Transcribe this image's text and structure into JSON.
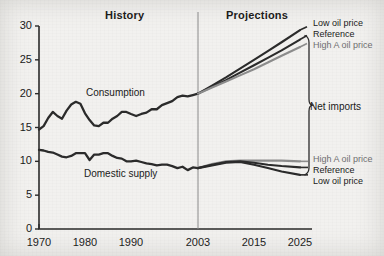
{
  "figure": {
    "background_color": "#f2f1ef",
    "ink_color": "#2b2b2b",
    "grey_series_color": "#8d8d8d"
  },
  "headers": {
    "history": "History",
    "projections": "Projections"
  },
  "inline_labels": {
    "consumption": "Consumption",
    "domestic_supply": "Domestic supply",
    "net_imports": "Net imports"
  },
  "upper_legend": [
    {
      "label": "Low oil price",
      "color": "#2b2b2b"
    },
    {
      "label": "Reference",
      "color": "#2b2b2b"
    },
    {
      "label": "High A oil price",
      "color": "#8d8d8d"
    }
  ],
  "lower_legend": [
    {
      "label": "High A oil price",
      "color": "#8d8d8d"
    },
    {
      "label": "Reference",
      "color": "#2b2b2b"
    },
    {
      "label": "Low oil price",
      "color": "#2b2b2b"
    }
  ],
  "chart_data": {
    "type": "line",
    "title": "",
    "subtitle": "",
    "xlabel": "",
    "ylabel": "",
    "xlim": [
      1970,
      2025
    ],
    "ylim": [
      0,
      30
    ],
    "grid": false,
    "legend_position": "right-inline",
    "x_ticks": [
      1970,
      1980,
      1990,
      2003,
      2015,
      2025
    ],
    "y_ticks": [
      0,
      5,
      10,
      15,
      20,
      25,
      30
    ],
    "annotations": [
      {
        "text": "History",
        "x": 1986,
        "y": 31.5
      },
      {
        "text": "Projections",
        "x": 2013,
        "y": 31.5
      },
      {
        "text": "Consumption",
        "x": 1985,
        "y": 20.6
      },
      {
        "text": "Domestic supply",
        "x": 1985,
        "y": 7.9
      },
      {
        "text": "Net imports",
        "x": 2027,
        "y": 15.5
      }
    ],
    "divider_x": 2003,
    "series": [
      {
        "name": "Consumption (history)",
        "color": "#2b2b2b",
        "phase": "history",
        "x": [
          1970,
          1971,
          1972,
          1973,
          1974,
          1975,
          1976,
          1977,
          1978,
          1979,
          1980,
          1981,
          1982,
          1983,
          1984,
          1985,
          1986,
          1987,
          1988,
          1989,
          1990,
          1991,
          1992,
          1993,
          1994,
          1995,
          1996,
          1997,
          1998,
          1999,
          2000,
          2001,
          2002,
          2003
        ],
        "values": [
          14.7,
          15.2,
          16.4,
          17.3,
          16.7,
          16.3,
          17.5,
          18.4,
          18.8,
          18.5,
          17.1,
          16.1,
          15.3,
          15.2,
          15.7,
          15.7,
          16.3,
          16.7,
          17.3,
          17.3,
          17.0,
          16.7,
          17.0,
          17.2,
          17.7,
          17.7,
          18.3,
          18.6,
          18.9,
          19.5,
          19.7,
          19.6,
          19.8,
          20.0
        ]
      },
      {
        "name": "Domestic supply (history)",
        "color": "#2b2b2b",
        "phase": "history",
        "x": [
          1970,
          1971,
          1972,
          1973,
          1974,
          1975,
          1976,
          1977,
          1978,
          1979,
          1980,
          1981,
          1982,
          1983,
          1984,
          1985,
          1986,
          1987,
          1988,
          1989,
          1990,
          1991,
          1992,
          1993,
          1994,
          1995,
          1996,
          1997,
          1998,
          1999,
          2000,
          2001,
          2002,
          2003
        ],
        "values": [
          11.7,
          11.6,
          11.4,
          11.3,
          11.0,
          10.7,
          10.6,
          10.8,
          11.2,
          11.2,
          11.2,
          10.2,
          11.0,
          11.0,
          11.2,
          11.2,
          10.8,
          10.5,
          10.4,
          10.0,
          10.0,
          10.1,
          9.9,
          9.7,
          9.6,
          9.4,
          9.5,
          9.5,
          9.3,
          9.0,
          9.2,
          8.7,
          9.1,
          9.0
        ]
      },
      {
        "name": "Consumption — Low oil price",
        "color": "#2b2b2b",
        "phase": "projection",
        "x": [
          2003,
          2006,
          2009,
          2012,
          2015,
          2018,
          2021,
          2025
        ],
        "values": [
          20.0,
          21.2,
          22.4,
          23.7,
          25.0,
          26.3,
          27.6,
          29.4
        ]
      },
      {
        "name": "Consumption — Reference",
        "color": "#2b2b2b",
        "phase": "projection",
        "x": [
          2003,
          2006,
          2009,
          2012,
          2015,
          2018,
          2021,
          2025
        ],
        "values": [
          20.0,
          21.0,
          22.0,
          23.1,
          24.2,
          25.3,
          26.4,
          28.0
        ]
      },
      {
        "name": "Consumption — High A oil price",
        "color": "#8d8d8d",
        "phase": "projection",
        "x": [
          2003,
          2006,
          2009,
          2012,
          2015,
          2018,
          2021,
          2025
        ],
        "values": [
          20.0,
          20.9,
          21.8,
          22.7,
          23.6,
          24.6,
          25.6,
          26.9
        ]
      },
      {
        "name": "Domestic supply — High A oil price",
        "color": "#8d8d8d",
        "phase": "projection",
        "x": [
          2003,
          2006,
          2009,
          2012,
          2015,
          2018,
          2021,
          2025
        ],
        "values": [
          9.0,
          9.6,
          10.0,
          10.1,
          10.1,
          10.1,
          10.1,
          10.0
        ]
      },
      {
        "name": "Domestic supply — Reference",
        "color": "#2b2b2b",
        "phase": "projection",
        "x": [
          2003,
          2006,
          2009,
          2012,
          2015,
          2018,
          2021,
          2025
        ],
        "values": [
          9.0,
          9.5,
          9.9,
          10.0,
          9.8,
          9.5,
          9.3,
          9.1
        ]
      },
      {
        "name": "Domestic supply — Low oil price",
        "color": "#2b2b2b",
        "phase": "projection",
        "x": [
          2003,
          2006,
          2009,
          2012,
          2015,
          2018,
          2021,
          2025
        ],
        "values": [
          9.0,
          9.4,
          9.8,
          9.9,
          9.5,
          9.0,
          8.5,
          8.0
        ]
      }
    ]
  }
}
